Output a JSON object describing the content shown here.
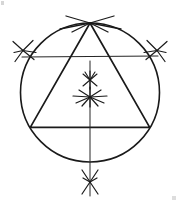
{
  "figure": {
    "title": "Compass and straightedge construction: equilateral triangle inscribed in a circle",
    "background_color": "#ffffff",
    "ink_color": "#1a1a1a",
    "canvas": {
      "width": 180,
      "height": 204
    }
  },
  "circle": {
    "label": "circumscribed-circle",
    "cx": 90,
    "cy": 92.5,
    "r": 69.5,
    "stroke_width": 1.6,
    "color": "#1a1a1a"
  },
  "triangle": {
    "label": "inscribed-equilateral-triangle",
    "stroke_width": 1.7,
    "color": "#1a1a1a",
    "vertices": [
      {
        "name": "apex",
        "x": 90,
        "y": 23
      },
      {
        "name": "base-left",
        "x": 30.3,
        "y": 127.3
      },
      {
        "name": "base-right",
        "x": 149.7,
        "y": 127.3
      }
    ],
    "points_attr": "90,23 30.3,127.3 149.7,127.3"
  },
  "chords": {
    "label": "bisector-chords",
    "stroke_width": 1.1,
    "color": "#262626",
    "items": [
      {
        "name": "chord-left-to-right-lower",
        "x1": 22.0,
        "y1": 57.0,
        "x2": 158.0,
        "y2": 56.0
      }
    ]
  },
  "axis": {
    "label": "vertical-axis",
    "stroke_width": 1.0,
    "color": "#262626",
    "x1": 90,
    "y1": 61,
    "x2": 90,
    "y2": 196
  },
  "rays_from_apex": {
    "label": "apex-construction-rays",
    "origin": {
      "x": 90,
      "y": 23
    },
    "stroke_width": 1.3,
    "color": "#1a1a1a",
    "endpoints": [
      {
        "x": 66,
        "y": 16
      },
      {
        "x": 114,
        "y": 16
      },
      {
        "x": 60,
        "y": 29
      },
      {
        "x": 121,
        "y": 29
      },
      {
        "x": 72,
        "y": 32
      },
      {
        "x": 108,
        "y": 32
      }
    ]
  },
  "arc_marks": [
    {
      "name": "arc-mark-left",
      "kind": "x-cross",
      "cx": 23.0,
      "cy": 50.5,
      "rays": [
        {
          "dx": -10,
          "dy": -9
        },
        {
          "dx": 11,
          "dy": 9
        },
        {
          "dx": -8,
          "dy": 11
        },
        {
          "dx": 10,
          "dy": -10
        },
        {
          "dx": 13,
          "dy": 2
        },
        {
          "dx": -9,
          "dy": 2
        }
      ],
      "stroke_width": 1.2
    },
    {
      "name": "arc-mark-right",
      "kind": "x-cross",
      "cx": 157.0,
      "cy": 50.5,
      "rays": [
        {
          "dx": 10,
          "dy": -9
        },
        {
          "dx": -11,
          "dy": 9
        },
        {
          "dx": 8,
          "dy": 11
        },
        {
          "dx": -10,
          "dy": -10
        },
        {
          "dx": -13,
          "dy": 2
        },
        {
          "dx": 9,
          "dy": 2
        }
      ],
      "stroke_width": 1.2
    },
    {
      "name": "arc-mark-upper-center",
      "kind": "starburst",
      "cx": 90.0,
      "cy": 80.0,
      "rays": [
        {
          "dx": 0,
          "dy": -9
        },
        {
          "dx": 0,
          "dy": 9
        },
        {
          "dx": -7,
          "dy": -6
        },
        {
          "dx": 7,
          "dy": -6
        },
        {
          "dx": -7,
          "dy": 6
        },
        {
          "dx": 7,
          "dy": 6
        },
        {
          "dx": -5,
          "dy": -8
        },
        {
          "dx": 5,
          "dy": -8
        }
      ],
      "stroke_width": 1.1
    },
    {
      "name": "arc-mark-centroid",
      "kind": "starburst",
      "cx": 90.0,
      "cy": 97.0,
      "rays": [
        {
          "dx": -17,
          "dy": -1
        },
        {
          "dx": 17,
          "dy": -1
        },
        {
          "dx": -14,
          "dy": 6
        },
        {
          "dx": 14,
          "dy": 6
        },
        {
          "dx": -11,
          "dy": -7
        },
        {
          "dx": 11,
          "dy": -7
        },
        {
          "dx": -8,
          "dy": 9
        },
        {
          "dx": 8,
          "dy": 9
        },
        {
          "dx": 0,
          "dy": -10
        },
        {
          "dx": 0,
          "dy": 10
        }
      ],
      "stroke_width": 1.2
    },
    {
      "name": "arc-mark-bottom",
      "kind": "x-cross",
      "cx": 90.0,
      "cy": 182.0,
      "rays": [
        {
          "dx": -8,
          "dy": -12
        },
        {
          "dx": 8,
          "dy": -12
        },
        {
          "dx": -8,
          "dy": 12
        },
        {
          "dx": 8,
          "dy": 12
        },
        {
          "dx": -7,
          "dy": -4
        },
        {
          "dx": 7,
          "dy": -4
        }
      ],
      "stroke_width": 1.2
    }
  ],
  "artifacts": [
    {
      "name": "corner-speck-top-left",
      "x": 1,
      "y": 1,
      "w": 3,
      "h": 4,
      "color": "#c8c8c8"
    },
    {
      "name": "corner-speck-bottom-right",
      "x": 172,
      "y": 196,
      "w": 4,
      "h": 4,
      "color": "#d2d2d2"
    }
  ]
}
